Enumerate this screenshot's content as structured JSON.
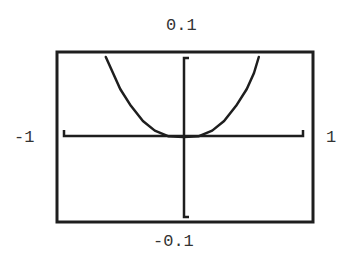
{
  "chart_data": {
    "type": "line",
    "title": "",
    "xlabel": "",
    "ylabel": "",
    "xlim": [
      -1,
      1
    ],
    "ylim": [
      -0.1,
      0.1
    ],
    "grid": false,
    "legend": null,
    "tick_labels": {
      "y_max": "0.1",
      "y_min": "-0.1",
      "x_min": "-1",
      "x_max": "1"
    },
    "series": [
      {
        "name": "curve",
        "x": [
          -0.65,
          -0.59,
          -0.53,
          -0.44,
          -0.34,
          -0.24,
          -0.13,
          0.0,
          0.13,
          0.24,
          0.34,
          0.44,
          0.53,
          0.59,
          0.63
        ],
        "y": [
          0.1,
          0.08,
          0.06,
          0.039,
          0.02,
          0.008,
          0.001,
          0.0,
          0.001,
          0.008,
          0.02,
          0.039,
          0.06,
          0.08,
          0.1
        ]
      }
    ]
  },
  "labels": {
    "y_max": "0.1",
    "y_min": "-0.1",
    "x_min": "-1",
    "x_max": "1"
  },
  "colors": {
    "line": "#1e1e1e",
    "background": "#ffffff"
  }
}
